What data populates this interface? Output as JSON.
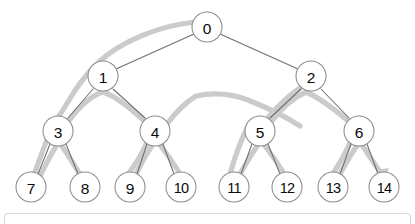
{
  "diagram": {
    "type": "binary-tree",
    "background_color": "#ffffff",
    "node_fill_color": "#ffffff",
    "node_stroke_color": "#8c8c8c",
    "edge_color": "#6e6e6e",
    "path_color": "#cbcbcb",
    "label_color": "#0a0a0a",
    "node_radius": 15,
    "nodes": [
      {
        "id": "n0",
        "label": "0",
        "x": 207,
        "y": 27,
        "level": 0
      },
      {
        "id": "n1",
        "label": "1",
        "x": 103,
        "y": 76,
        "level": 1
      },
      {
        "id": "n2",
        "label": "2",
        "x": 311,
        "y": 76,
        "level": 1
      },
      {
        "id": "n3",
        "label": "3",
        "x": 58,
        "y": 131,
        "level": 2
      },
      {
        "id": "n4",
        "label": "4",
        "x": 155,
        "y": 131,
        "level": 2
      },
      {
        "id": "n5",
        "label": "5",
        "x": 260,
        "y": 131,
        "level": 2
      },
      {
        "id": "n6",
        "label": "6",
        "x": 359,
        "y": 131,
        "level": 2
      },
      {
        "id": "n7",
        "label": "7",
        "x": 31,
        "y": 187,
        "level": 3
      },
      {
        "id": "n8",
        "label": "8",
        "x": 85,
        "y": 187,
        "level": 3
      },
      {
        "id": "n9",
        "label": "9",
        "x": 130,
        "y": 187,
        "level": 3
      },
      {
        "id": "n10",
        "label": "10",
        "x": 181,
        "y": 187,
        "level": 3
      },
      {
        "id": "n11",
        "label": "11",
        "x": 234,
        "y": 187,
        "level": 3
      },
      {
        "id": "n12",
        "label": "12",
        "x": 287,
        "y": 187,
        "level": 3
      },
      {
        "id": "n13",
        "label": "13",
        "x": 333,
        "y": 187,
        "level": 3
      },
      {
        "id": "n14",
        "label": "14",
        "x": 384,
        "y": 187,
        "level": 3
      }
    ],
    "edges": [
      {
        "from": "n0",
        "to": "n1"
      },
      {
        "from": "n0",
        "to": "n2"
      },
      {
        "from": "n1",
        "to": "n3"
      },
      {
        "from": "n1",
        "to": "n4"
      },
      {
        "from": "n2",
        "to": "n5"
      },
      {
        "from": "n2",
        "to": "n6"
      },
      {
        "from": "n3",
        "to": "n7"
      },
      {
        "from": "n3",
        "to": "n8"
      },
      {
        "from": "n4",
        "to": "n9"
      },
      {
        "from": "n4",
        "to": "n10"
      },
      {
        "from": "n5",
        "to": "n11"
      },
      {
        "from": "n5",
        "to": "n12"
      },
      {
        "from": "n6",
        "to": "n13"
      },
      {
        "from": "n6",
        "to": "n14"
      }
    ],
    "traversal": {
      "description": "depth-first traversal path drawn as a thick light gray curve hugging the outside of the tree, terminating with an arrowhead at node 14",
      "has_arrowhead": true,
      "arrowhead_target": "n14",
      "visit_order": [
        "0",
        "1",
        "3",
        "7",
        "8",
        "4",
        "9",
        "10",
        "2",
        "5",
        "11",
        "12",
        "6",
        "13",
        "14"
      ]
    }
  },
  "bottom_panel": {
    "present": true,
    "border_color": "#d6d6d6"
  }
}
